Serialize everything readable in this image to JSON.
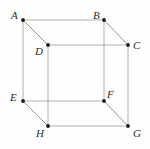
{
  "figure": {
    "kind": "cube-wireframe-diagram",
    "width": 150,
    "height": 149,
    "background_color": "#fefefe",
    "edge_color_axis": "#a9a9a9",
    "edge_color_diagonal": "#7d7d7d",
    "vertex_dot_color": "#1c1c1c",
    "label_color": "#2b2b2b"
  },
  "vertices": [
    {
      "id": "A",
      "label": "A",
      "x": 23,
      "y": 20,
      "label_x": 11,
      "label_y": 10
    },
    {
      "id": "B",
      "label": "B",
      "x": 104,
      "y": 20,
      "label_x": 93,
      "label_y": 10
    },
    {
      "id": "C",
      "label": "C",
      "x": 128,
      "y": 45,
      "label_x": 133,
      "label_y": 40
    },
    {
      "id": "D",
      "label": "D",
      "x": 48,
      "y": 45,
      "label_x": 35,
      "label_y": 46
    },
    {
      "id": "E",
      "label": "E",
      "x": 23,
      "y": 101,
      "label_x": 10,
      "label_y": 92
    },
    {
      "id": "F",
      "label": "F",
      "x": 104,
      "y": 101,
      "label_x": 107,
      "label_y": 89
    },
    {
      "id": "G",
      "label": "G",
      "x": 128,
      "y": 126,
      "label_x": 133,
      "label_y": 128
    },
    {
      "id": "H",
      "label": "H",
      "x": 48,
      "y": 126,
      "label_x": 36,
      "label_y": 128
    }
  ],
  "edges": [
    {
      "from": "A",
      "to": "B",
      "style": "axis"
    },
    {
      "from": "A",
      "to": "E",
      "style": "axis"
    },
    {
      "from": "B",
      "to": "F",
      "style": "axis"
    },
    {
      "from": "E",
      "to": "F",
      "style": "axis"
    },
    {
      "from": "D",
      "to": "C",
      "style": "axis"
    },
    {
      "from": "D",
      "to": "H",
      "style": "axis"
    },
    {
      "from": "C",
      "to": "G",
      "style": "axis"
    },
    {
      "from": "H",
      "to": "G",
      "style": "axis"
    },
    {
      "from": "A",
      "to": "D",
      "style": "diagonal"
    },
    {
      "from": "B",
      "to": "C",
      "style": "diagonal"
    },
    {
      "from": "E",
      "to": "H",
      "style": "diagonal"
    },
    {
      "from": "F",
      "to": "G",
      "style": "diagonal"
    }
  ]
}
